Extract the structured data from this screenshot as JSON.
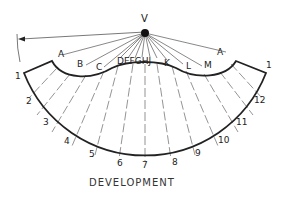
{
  "diagram": {
    "type": "sheet-metal cone development",
    "vertex_label": "V",
    "caption": "DEVELOPMENT",
    "element_labels_upper": [
      "A",
      "B",
      "C",
      "D",
      "E",
      "F",
      "G",
      "H",
      "J",
      "K",
      "L",
      "M",
      "A"
    ],
    "element_labels_lower": [
      "1",
      "2",
      "3",
      "4",
      "5",
      "6",
      "7",
      "8",
      "9",
      "10",
      "11",
      "12",
      "1"
    ],
    "labels": {
      "A_left": "A",
      "B": "B",
      "C": "C",
      "DEFGHJ": "DEFGHJ",
      "K": "K",
      "L": "L",
      "M": "M",
      "A_right": "A",
      "n1_left": "1",
      "n2": "2",
      "n3": "3",
      "n4": "4",
      "n5": "5",
      "n6": "6",
      "n7": "7",
      "n8": "8",
      "n9": "9",
      "n10": "10",
      "n11": "11",
      "n12": "12",
      "n1_right": "1"
    },
    "colors": {
      "line": "#222222",
      "thin_line": "#555555",
      "background": "#ffffff"
    }
  }
}
